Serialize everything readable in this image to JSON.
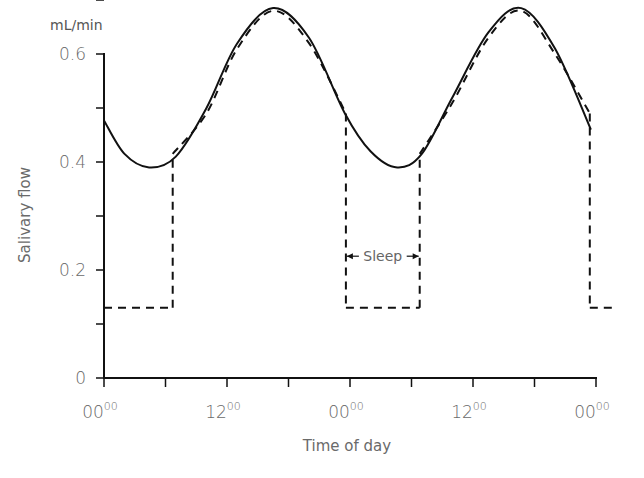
{
  "chart_data": {
    "type": "line",
    "title": "",
    "xlabel": "Time of day",
    "ylabel": "Salivary flow",
    "yunit": "mL/min",
    "ylim": [
      0,
      0.7
    ],
    "xlim_hours": [
      0,
      48
    ],
    "y_ticks": [
      {
        "value": 0,
        "label": "0",
        "labeled": true
      },
      {
        "value": 0.1,
        "label": "",
        "labeled": false
      },
      {
        "value": 0.2,
        "label": "0.2",
        "labeled": true
      },
      {
        "value": 0.3,
        "label": "",
        "labeled": false
      },
      {
        "value": 0.4,
        "label": "0.4",
        "labeled": true
      },
      {
        "value": 0.5,
        "label": "",
        "labeled": false
      },
      {
        "value": 0.6,
        "label": "0.6",
        "labeled": true
      },
      {
        "value": 0.7,
        "label": "",
        "labeled": false
      }
    ],
    "x_ticks": [
      {
        "hour": 0,
        "main": "00",
        "sup": "00",
        "labeled": true
      },
      {
        "hour": 6,
        "labeled": false
      },
      {
        "hour": 12,
        "main": "12",
        "sup": "00",
        "labeled": true
      },
      {
        "hour": 18,
        "labeled": false
      },
      {
        "hour": 24,
        "main": "00",
        "sup": "00",
        "labeled": true
      },
      {
        "hour": 30,
        "labeled": false
      },
      {
        "hour": 36,
        "main": "12",
        "sup": "00",
        "labeled": true
      },
      {
        "hour": 42,
        "labeled": false
      },
      {
        "hour": 48,
        "main": "00",
        "sup": "00",
        "labeled": true
      }
    ],
    "grid": false,
    "legend": null,
    "series": [
      {
        "name": "Circadian rhythm (continuous)",
        "style": "solid",
        "x_hours": [
          0,
          2,
          4.4,
          7,
          10,
          13,
          16.5,
          20,
          23.5,
          26,
          28.6,
          31,
          34,
          37.5,
          40.7,
          44,
          47.5
        ],
        "values": [
          0.477,
          0.415,
          0.39,
          0.41,
          0.5,
          0.62,
          0.685,
          0.63,
          0.49,
          0.42,
          0.39,
          0.415,
          0.52,
          0.64,
          0.685,
          0.61,
          0.46
        ]
      },
      {
        "name": "Actual flow (with sleep)",
        "style": "dashed",
        "x_hours": [
          0,
          6.7,
          6.7,
          10,
          13,
          16.5,
          20,
          23.6,
          23.6,
          30.8,
          30.8,
          34,
          37.5,
          40.7,
          44,
          47.4,
          47.4,
          50
        ],
        "values": [
          0.13,
          0.13,
          0.415,
          0.49,
          0.61,
          0.68,
          0.62,
          0.49,
          0.13,
          0.13,
          0.415,
          0.51,
          0.63,
          0.68,
          0.6,
          0.49,
          0.13,
          0.13
        ]
      }
    ],
    "annotations": [
      {
        "text": "Sleep",
        "type": "double-arrow",
        "x_start_hour": 23.6,
        "x_end_hour": 30.8,
        "y": 0.22
      }
    ]
  }
}
